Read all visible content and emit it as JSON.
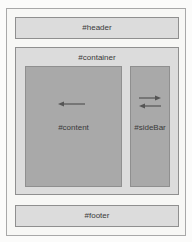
{
  "diagram": {
    "header": {
      "label": "#header"
    },
    "container": {
      "label": "#container"
    },
    "content": {
      "label": "#content",
      "arrow": "arrow-left"
    },
    "sidebar": {
      "label": "#sideBar",
      "arrows": [
        "arrow-right",
        "arrow-left"
      ]
    },
    "footer": {
      "label": "#footer"
    },
    "colors": {
      "background": "#f7f7f5",
      "light_box": "#dcdcdc",
      "dark_box": "#a9a9a9",
      "border": "#8f8f8f",
      "text": "#3a3a3a"
    }
  }
}
